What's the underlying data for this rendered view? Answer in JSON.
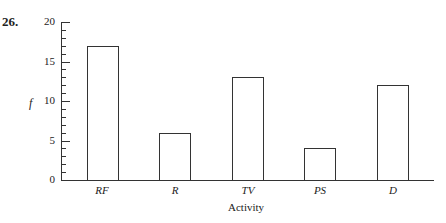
{
  "problem_number": "26.",
  "chart_data": {
    "type": "bar",
    "title": "",
    "categories": [
      "RF",
      "R",
      "TV",
      "PS",
      "D"
    ],
    "values": [
      17,
      6,
      13,
      4,
      12
    ],
    "xlabel": "Activity",
    "ylabel": "f",
    "ylim": [
      0,
      20
    ],
    "yticks": [
      "0",
      "5",
      "10",
      "15",
      "20"
    ],
    "grid": false,
    "legend": null
  }
}
